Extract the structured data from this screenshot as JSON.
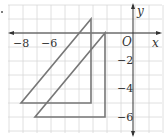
{
  "figure": {
    "x_axis_label": "x",
    "y_axis_label": "y",
    "origin_label": "O",
    "x_ticks": [
      {
        "value": -8,
        "label": "−8"
      },
      {
        "value": -6,
        "label": "−6"
      }
    ],
    "y_ticks": [
      {
        "value": -2,
        "label": "−2"
      },
      {
        "value": -4,
        "label": "−4"
      },
      {
        "value": -6,
        "label": "−6"
      }
    ],
    "grid": {
      "x_min": -9,
      "x_max": 2,
      "y_min": -7,
      "y_max": 2
    },
    "shapes": [
      {
        "name": "triangle-a",
        "vertices": [
          [
            -8,
            -5
          ],
          [
            -3,
            -5
          ],
          [
            -3,
            1
          ]
        ]
      },
      {
        "name": "triangle-b",
        "vertices": [
          [
            -7,
            -6
          ],
          [
            -2,
            -6
          ],
          [
            -2,
            0
          ]
        ]
      }
    ],
    "colors": {
      "grid": "#d8d8d8",
      "axis": "#333333",
      "shape": "#777777"
    }
  }
}
